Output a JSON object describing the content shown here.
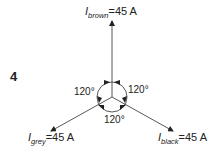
{
  "figure_number": "4",
  "phasors": {
    "brown": {
      "symbol": "I",
      "subscript": "brown",
      "equals": "=45 A"
    },
    "grey": {
      "symbol": "I",
      "subscript": "grey",
      "equals": "=45 A"
    },
    "black": {
      "symbol": "I",
      "subscript": "black",
      "equals": "=45 A"
    }
  },
  "angles": {
    "left": "120°",
    "right": "120°",
    "bottom": "120°"
  },
  "colors": {
    "line": "#444444",
    "text": "#222222"
  }
}
